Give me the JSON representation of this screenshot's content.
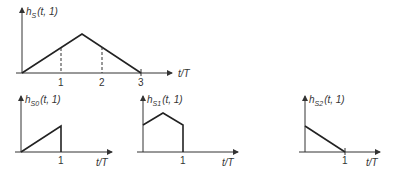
{
  "plots": {
    "main": {
      "ylabel_h": "h",
      "ylabel_sub": "S",
      "ylabel_args": "(t, 1)",
      "xlabel": "t/T",
      "ticks": [
        "1",
        "2",
        "3"
      ],
      "points_tT": [
        [
          0,
          0
        ],
        [
          1.5,
          1
        ],
        [
          3,
          0
        ]
      ]
    },
    "s0": {
      "ylabel_h": "h",
      "ylabel_sub": "S0",
      "ylabel_args": "(t, 1)",
      "xlabel": "t/T",
      "ticks": [
        "1"
      ]
    },
    "s1": {
      "ylabel_h": "h",
      "ylabel_sub": "S1",
      "ylabel_args": "(t, 1)",
      "xlabel": "t/T",
      "ticks": [
        "1"
      ]
    },
    "s2": {
      "ylabel_h": "h",
      "ylabel_sub": "S2",
      "ylabel_args": "(t, 1)",
      "xlabel": "t/T",
      "ticks": [
        "1"
      ]
    }
  }
}
